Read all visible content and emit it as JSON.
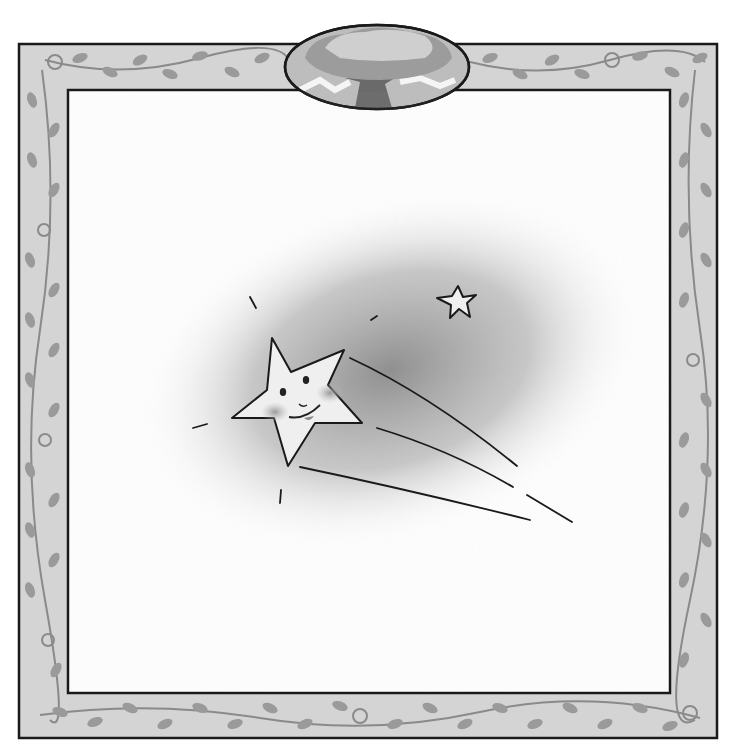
{
  "illustration": {
    "subject": "smiling shooting star with small star",
    "palette": {
      "frame_fill": "#d4d4d4",
      "leaf": "#9a9a9a",
      "vine": "#8a8a8a",
      "outline": "#1a1a1a",
      "haze": "#8c8c8c",
      "star_fill": "#efefef",
      "cheek": "#a0a0a0"
    },
    "frame": {
      "outer": [
        18,
        43,
        718,
        739
      ],
      "inner": [
        68,
        90,
        670,
        693
      ]
    },
    "medallion": {
      "cx": 377,
      "cy": 67,
      "rx": 93,
      "ry": 42,
      "content": "tree with cloud-like canopy"
    },
    "main_star": {
      "cx": 296,
      "cy": 400
    },
    "small_star": {
      "cx": 459,
      "cy": 304
    }
  }
}
